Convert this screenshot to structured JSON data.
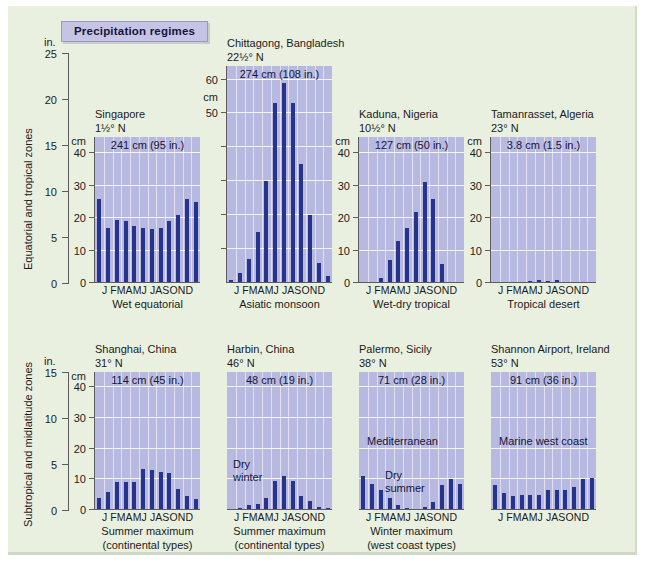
{
  "figure": {
    "title": "Precipitation regimes",
    "background_color": "#eaf0e0",
    "bar_color": "#26348c",
    "plot_background_color": "#b8b9e0",
    "badge_color": "#c6c4e4",
    "row_labels": {
      "top": "Equatorial and tropical zones",
      "bottom": "Subtropical and midlatitude zones"
    },
    "axis_units": {
      "inches": "in.",
      "centimeters": "cm"
    },
    "month_labels": "J FMAMJ JASOND"
  },
  "axes": {
    "top_inch": {
      "unit": "in.",
      "ticks": [
        "25",
        "20",
        "15",
        "10",
        "5",
        "0"
      ],
      "max": 25
    },
    "bottom_inch": {
      "unit": "in.",
      "ticks": [
        "15",
        "10",
        "5",
        "0"
      ],
      "max": 15
    },
    "cm40": {
      "unit": "cm",
      "ticks": [
        "40",
        "30",
        "20",
        "10",
        "0"
      ],
      "max": 45
    },
    "cm60": {
      "unit": "cm",
      "ticks": [
        "60",
        "50"
      ],
      "max": 64
    }
  },
  "chart_data": {
    "type": "bar",
    "title": "Precipitation regimes",
    "xlabel": "Month",
    "ylabel": "Precipitation",
    "grid": true,
    "categories": [
      "J",
      "F",
      "M",
      "A",
      "M",
      "J",
      "J",
      "A",
      "S",
      "O",
      "N",
      "D"
    ],
    "panels": [
      {
        "row": "Equatorial and tropical zones",
        "station": "Singapore",
        "latitude": "1½° N",
        "total": "241 cm (95 in.)",
        "regime": "Wet equatorial",
        "y_unit": "cm",
        "ylim": [
          0,
          45
        ],
        "values": [
          26,
          17,
          19.5,
          19,
          17.5,
          17,
          16.5,
          17,
          19,
          21,
          26,
          25
        ]
      },
      {
        "row": "Equatorial and tropical zones",
        "station": "Chittagong, Bangladesh",
        "latitude": "22½° N",
        "total": "274 cm (108 in.)",
        "regime": "Asiatic monsoon",
        "y_unit": "cm",
        "ylim": [
          0,
          64
        ],
        "values": [
          1,
          3,
          7,
          15,
          30,
          53,
          59,
          53,
          35,
          20,
          6,
          2
        ]
      },
      {
        "row": "Equatorial and tropical zones",
        "station": "Kaduna, Nigeria",
        "latitude": "10½° N",
        "total": "127 cm (50 in.)",
        "regime": "Wet-dry tropical",
        "y_unit": "cm",
        "ylim": [
          0,
          45
        ],
        "values": [
          0.3,
          0.4,
          1.5,
          7,
          13,
          17,
          22,
          31,
          26,
          6,
          0.4,
          0.3
        ]
      },
      {
        "row": "Equatorial and tropical zones",
        "station": "Tamanrasset, Algeria",
        "latitude": "23° N",
        "total": "3.8 cm (1.5 in.)",
        "regime": "Tropical desert",
        "y_unit": "cm",
        "ylim": [
          0,
          45
        ],
        "values": [
          0.3,
          0.3,
          0.4,
          0.3,
          0.5,
          0.8,
          0.5,
          0.8,
          0.4,
          0.3,
          0.4,
          0.3
        ]
      },
      {
        "row": "Subtropical and midlatitude zones",
        "station": "Shanghai, China",
        "latitude": "31° N",
        "total": "114 cm (45 in.)",
        "regime": "Summer maximum\n(continental types)",
        "y_unit": "cm",
        "ylim": [
          0,
          45
        ],
        "values": [
          4,
          6,
          9,
          9,
          9,
          13.5,
          13,
          12.5,
          12,
          7,
          4.5,
          3.5
        ]
      },
      {
        "row": "Subtropical and midlatitude zones",
        "station": "Harbin, China",
        "latitude": "46° N",
        "total": "48 cm (19 in.)",
        "regime": "Summer maximum\n(continental types)",
        "annotation": "Dry\nwinter",
        "y_unit": "cm",
        "ylim": [
          0,
          45
        ],
        "values": [
          0.4,
          0.5,
          1.5,
          2,
          4,
          9.5,
          11,
          9.5,
          4.5,
          3,
          1,
          0.5
        ]
      },
      {
        "row": "Subtropical and midlatitude zones",
        "station": "Palermo, Sicily",
        "latitude": "38° N",
        "total": "71 cm (28 in.)",
        "regime": "Winter maximum\n(west coast types)",
        "annotation": "Dry\nsummer",
        "label": "Mediterranean",
        "y_unit": "cm",
        "ylim": [
          0,
          45
        ],
        "values": [
          11,
          8.5,
          6.5,
          4,
          1.5,
          0.5,
          0.3,
          1,
          2.5,
          8,
          10,
          8.5
        ]
      },
      {
        "row": "Subtropical and midlatitude zones",
        "station": "Shannon Airport, Ireland",
        "latitude": "53° N",
        "total": "91 cm (36 in.)",
        "regime": "Winter maximum\n(west coast types)",
        "label": "Marine west coast",
        "y_unit": "cm",
        "ylim": [
          0,
          45
        ],
        "values": [
          8,
          5.5,
          4.5,
          5,
          5,
          5,
          6.5,
          6.5,
          6.5,
          7.5,
          10,
          10.5
        ]
      }
    ]
  },
  "captions": {
    "top": [
      "Wet equatorial",
      "Asiatic monsoon",
      "Wet-dry tropical",
      "Tropical desert"
    ],
    "bottom_left": "Summer maximum\n(continental types)",
    "bottom_right": "Winter maximum\n(west coast types)"
  }
}
